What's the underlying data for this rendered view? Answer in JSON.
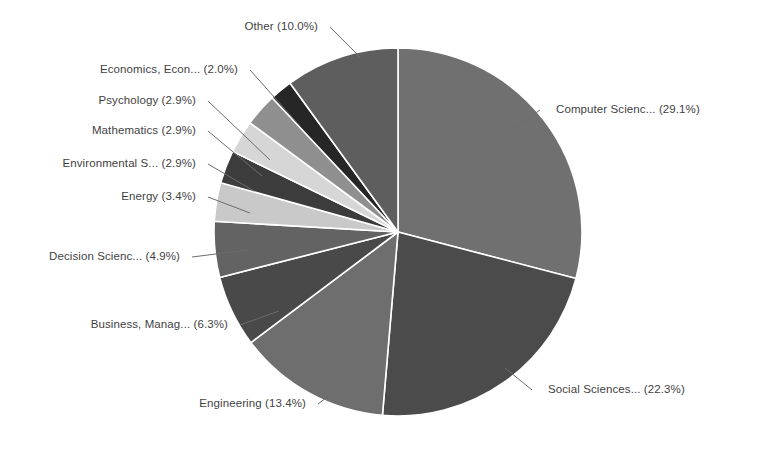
{
  "chart_data": {
    "type": "pie",
    "title": "",
    "subtitle": "",
    "xlabel": "",
    "ylabel": "",
    "legend_position": "none",
    "grid": false,
    "labels_show_percent": true,
    "start_angle_deg": 0,
    "direction": "clockwise",
    "categories": [
      "Computer Scienc...",
      "Social Sciences...",
      "Engineering",
      "Business, Manag...",
      "Decision Scienc...",
      "Energy",
      "Environmental S...",
      "Mathematics",
      "Psychology",
      "Economics, Econ...",
      "Other"
    ],
    "values": [
      29.1,
      22.3,
      13.4,
      6.3,
      4.9,
      3.4,
      2.9,
      2.9,
      2.9,
      2.0,
      10.0
    ],
    "value_unit": "%",
    "colors": [
      "#707070",
      "#4b4b4b",
      "#6e6e6e",
      "#494949",
      "#636363",
      "#c9c9c9",
      "#3c3c3c",
      "#d6d6d6",
      "#8f8f8f",
      "#262626",
      "#5e5e5e"
    ]
  },
  "slice_labels": [
    {
      "text": "Computer Scienc... (29.1%)",
      "side": "right"
    },
    {
      "text": "Social Sciences... (22.3%)",
      "side": "right"
    },
    {
      "text": "Engineering (13.4%)",
      "side": "left"
    },
    {
      "text": "Business, Manag... (6.3%)",
      "side": "left"
    },
    {
      "text": "Decision Scienc... (4.9%)",
      "side": "left"
    },
    {
      "text": "Energy (3.4%)",
      "side": "left"
    },
    {
      "text": "Environmental S... (2.9%)",
      "side": "left"
    },
    {
      "text": "Mathematics (2.9%)",
      "side": "left"
    },
    {
      "text": "Psychology (2.9%)",
      "side": "left"
    },
    {
      "text": "Economics, Econ... (2.0%)",
      "side": "left"
    },
    {
      "text": "Other (10.0%)",
      "side": "left"
    }
  ],
  "geometry": {
    "center_x": 398,
    "center_y": 232,
    "radius": 184
  },
  "style": {
    "background": "#ffffff",
    "text_color": "#3f3f3f",
    "leader_color": "#6d6d6d",
    "slice_border": "#ffffff"
  }
}
